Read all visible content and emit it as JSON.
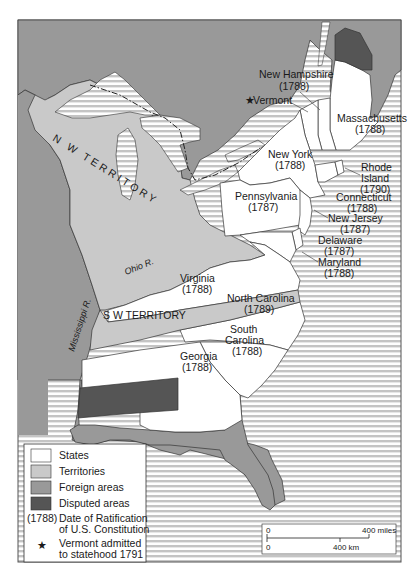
{
  "map": {
    "title": "",
    "colors": {
      "states": "#ffffff",
      "territories": "#c9c9c9",
      "foreign": "#999999",
      "disputed": "#555555",
      "water_stripe_light": "#ffffff",
      "water_stripe_dark": "#c4c4c4",
      "border": "#333333"
    },
    "regions": {
      "nw_territory": "N W TERRITORY",
      "sw_territory": "S W TERRITORY"
    },
    "rivers": {
      "ohio": "Ohio R.",
      "mississippi": "Mississippi R."
    },
    "states": [
      {
        "name": "New Hampshire",
        "year": "(1788)"
      },
      {
        "name": "Vermont",
        "year": ""
      },
      {
        "name": "Massachusetts",
        "year": "(1788)"
      },
      {
        "name": "New York",
        "year": "(1788)"
      },
      {
        "name": "Rhode",
        "name2": "Island",
        "year": "(1790)"
      },
      {
        "name": "Pennsylvania",
        "year": "(1787)"
      },
      {
        "name": "Connecticut",
        "year": "(1788)"
      },
      {
        "name": "New Jersey",
        "year": "(1787)"
      },
      {
        "name": "Delaware",
        "year": "(1787)"
      },
      {
        "name": "Maryland",
        "year": "(1788)"
      },
      {
        "name": "Virginia",
        "year": "(1788)"
      },
      {
        "name": "North Carolina",
        "year": "(1789)"
      },
      {
        "name": "South",
        "name2": "Carolina",
        "year": "(1788)"
      },
      {
        "name": "Georgia",
        "year": "(1788)"
      }
    ],
    "vermont_marker": "★",
    "legend": {
      "items": [
        {
          "label": "States"
        },
        {
          "label": "Territories"
        },
        {
          "label": "Foreign areas"
        },
        {
          "label": "Disputed areas"
        }
      ],
      "ratification_key": "(1788)",
      "ratification_line1": "Date of Ratification",
      "ratification_line2": "of U.S. Constitution",
      "star": "★",
      "vermont_line1": "Vermont admitted",
      "vermont_line2": "to statehood 1791"
    },
    "scale": {
      "zero_top": "0",
      "miles_label": "400 miles",
      "zero_bottom": "0",
      "km_label": "400 km"
    }
  }
}
